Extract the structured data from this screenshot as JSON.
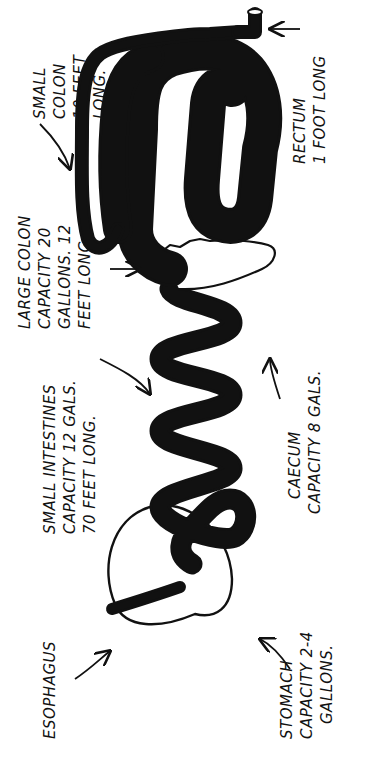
{
  "diagram": {
    "labels": {
      "esophagus": [
        "ESOPHAGUS"
      ],
      "stomach": [
        "STOMACH",
        "CAPACITY 2-4",
        "GALLONS."
      ],
      "small_intestines": [
        "SMALL INTESTINES",
        "CAPACITY 12 GALS.",
        "70 FEET LONG."
      ],
      "cecum": [
        "CAECUM",
        "CAPACITY 8 GALS."
      ],
      "large_colon": [
        "LARGE COLON",
        "CAPACITY 20",
        "GALLONS. 12",
        "FEET LONG."
      ],
      "small_colon": [
        "SMALL",
        "COLON",
        "10 FEET",
        "LONG."
      ],
      "rectum": [
        "RECTUM",
        "1 FOOT LONG"
      ]
    },
    "colors": {
      "ink": "#111111",
      "fill_stipple": "#d9d9d9",
      "background": "#ffffff"
    }
  }
}
